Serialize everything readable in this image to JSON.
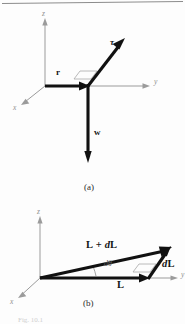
{
  "figure": {
    "panel_a": {
      "id": "(a)",
      "axes": [
        {
          "name": "z",
          "label": "z"
        },
        {
          "name": "y",
          "label": "y"
        },
        {
          "name": "x",
          "label": "x"
        }
      ],
      "vectors": [
        {
          "name": "r",
          "label": "r",
          "description": "position vector along y from origin"
        },
        {
          "name": "tau",
          "label": "τ",
          "description": "torque vector up and to the right"
        },
        {
          "name": "w",
          "label": "w",
          "description": "weight vector pointing straight down"
        }
      ]
    },
    "panel_b": {
      "id": "(b)",
      "axes": [
        {
          "name": "z",
          "label": "z"
        },
        {
          "name": "y",
          "label": "y"
        },
        {
          "name": "x",
          "label": "x"
        }
      ],
      "vectors": [
        {
          "name": "L-plus-dL",
          "label_l": "L",
          "label_plus": "+",
          "label_dl_d": "d",
          "label_dl_l": "L"
        },
        {
          "name": "L",
          "label": "L"
        },
        {
          "name": "dL",
          "label_d": "d",
          "label_l": "L"
        }
      ],
      "angle": {
        "name": "d-theta",
        "label": "dθ"
      }
    },
    "caption": "Fig. 10.1"
  },
  "colors": {
    "vector": "#111111",
    "axis": "#9b9b9b",
    "guide": "#a8a8a8",
    "background": "#fdfdfd",
    "caption": "#cfcfcf"
  }
}
